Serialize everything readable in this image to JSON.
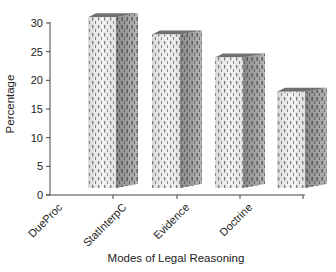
{
  "chart_data": {
    "type": "bar",
    "style": "3d-column",
    "title": "",
    "xlabel": "Modes of Legal Reasoning",
    "ylabel": "Percentage",
    "categories": [
      "DueProc",
      "StatInterpC",
      "Evidence",
      "Doctrine"
    ],
    "values": [
      31,
      28,
      24,
      18
    ],
    "ylim": [
      0,
      30
    ],
    "yticks": [
      0,
      5,
      10,
      15,
      20,
      25,
      30
    ],
    "ytick_labels": [
      "0",
      "5",
      "10",
      "15",
      "20",
      "25",
      "30"
    ],
    "grid": false,
    "legend": null,
    "colors": {
      "front_face": "#e8e8e8",
      "side_face": "#9a9a9a",
      "top_face": "#6e6e6e",
      "pattern_dash": "#555555",
      "axis": "#444444"
    }
  }
}
